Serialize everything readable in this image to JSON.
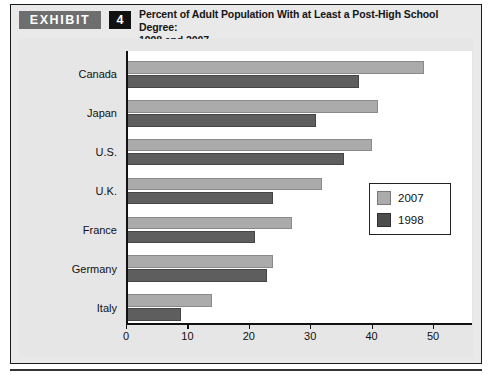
{
  "exhibit": {
    "tag_label": "EXHIBIT",
    "number": "4",
    "title_line1": "Percent of Adult Population With at Least a Post-High School Degree:",
    "title_line2": "1998 and 2007"
  },
  "colors": {
    "series_2007": "#ababab",
    "series_1998": "#5e5e5e",
    "panel_background": "#e6e6e6",
    "plot_background": "#ffffff",
    "axis": "#111111",
    "tag_background": "#6e6e6e",
    "number_background": "#111111"
  },
  "chart_data": {
    "type": "bar",
    "orientation": "horizontal",
    "title": "Percent of Adult Population With at Least a Post-High School Degree: 1998 and 2007",
    "xlabel": "",
    "ylabel": "",
    "xlim": [
      0,
      50
    ],
    "xticks": [
      0,
      10,
      20,
      30,
      40,
      50
    ],
    "xtick_labels": [
      "0",
      "10",
      "20",
      "30",
      "40",
      "50"
    ],
    "grid": false,
    "legend_position": "center-right",
    "categories": [
      "Canada",
      "Japan",
      "U.S.",
      "U.K.",
      "France",
      "Germany",
      "Italy"
    ],
    "series": [
      {
        "name": "2007",
        "color": "#ababab",
        "values": [
          48.5,
          41,
          40,
          32,
          27,
          24,
          14
        ]
      },
      {
        "name": "1998",
        "color": "#5e5e5e",
        "values": [
          38,
          31,
          35.5,
          24,
          21,
          23,
          9
        ]
      }
    ]
  }
}
